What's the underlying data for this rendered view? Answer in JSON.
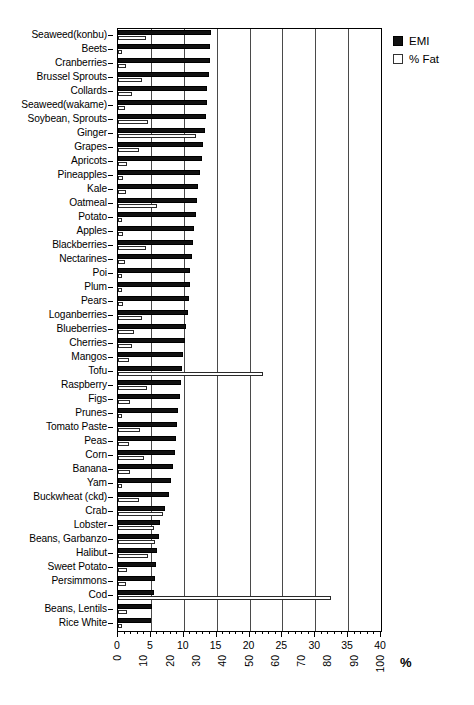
{
  "chart_data": {
    "type": "bar",
    "orientation": "horizontal",
    "title": "",
    "xlabel": "%",
    "ylabel": "",
    "grid": true,
    "legend_position": "top-right",
    "xlim_emi": [
      0,
      40
    ],
    "xlim_fat": [
      0,
      100
    ],
    "xticks_emi": [
      0,
      5,
      10,
      15,
      20,
      25,
      30,
      35,
      40
    ],
    "xticks_fat": [
      0,
      10,
      20,
      30,
      40,
      50,
      60,
      70,
      80,
      90,
      100
    ],
    "minor_tick_step": 1,
    "gridline_step": 5,
    "series": [
      {
        "name": "EMI",
        "axis": "top",
        "color": "#111111",
        "fill": "solid"
      },
      {
        "name": "% Fat",
        "axis": "bottom",
        "color": "#ffffff",
        "fill": "open"
      }
    ],
    "categories": [
      "Seaweed(konbu)",
      "Beets",
      "Cranberries",
      "Brussel Sprouts",
      "Collards",
      "Seaweed(wakame)",
      "Soybean, Sprouts",
      "Ginger",
      "Grapes",
      "Apricots",
      "Pineapples",
      "Kale",
      "Oatmeal",
      "Potato",
      "Apples",
      "Blackberries",
      "Nectarines",
      "Poi",
      "Plum",
      "Pears",
      "Loganberries",
      "Blueberries",
      "Cherries",
      "Mangos",
      "Tofu",
      "Raspberry",
      "Figs",
      "Prunes",
      "Tomato Paste",
      "Peas",
      "Corn",
      "Banana",
      "Yam",
      "Buckwheat (ckd)",
      "Crab",
      "Lobster",
      "Beans, Garbanzo",
      "Halibut",
      "Sweet Potato",
      "Persimmons",
      "Cod",
      "Beans, Lentils",
      "Rice White"
    ],
    "emi_values": [
      14.2,
      14.0,
      14.0,
      13.8,
      13.6,
      13.5,
      13.4,
      13.2,
      13.0,
      12.8,
      12.4,
      12.2,
      12.0,
      11.8,
      11.6,
      11.4,
      11.2,
      11.0,
      10.9,
      10.8,
      10.6,
      10.4,
      10.2,
      9.9,
      9.8,
      9.6,
      9.4,
      9.2,
      9.0,
      8.8,
      8.6,
      8.3,
      8.1,
      7.8,
      7.2,
      6.4,
      6.2,
      6.0,
      5.8,
      5.6,
      5.4,
      5.2,
      5.0
    ],
    "fat_values": [
      10.5,
      1.5,
      3.0,
      9.0,
      5.5,
      2.5,
      11.5,
      29.5,
      8.0,
      3.5,
      2.0,
      3.0,
      15.0,
      1.5,
      2.0,
      10.5,
      2.5,
      1.5,
      1.5,
      2.0,
      9.0,
      6.0,
      5.5,
      4.0,
      55.0,
      11.0,
      4.5,
      1.5,
      8.5,
      4.0,
      10.0,
      4.5,
      1.5,
      8.0,
      17.0,
      13.5,
      14.0,
      11.5,
      3.5,
      3.0,
      81.0,
      3.5,
      1.5
    ]
  },
  "legend": {
    "items": [
      {
        "label": "EMI"
      },
      {
        "label": "% Fat"
      }
    ]
  },
  "axis": {
    "percent_sign": "%"
  }
}
